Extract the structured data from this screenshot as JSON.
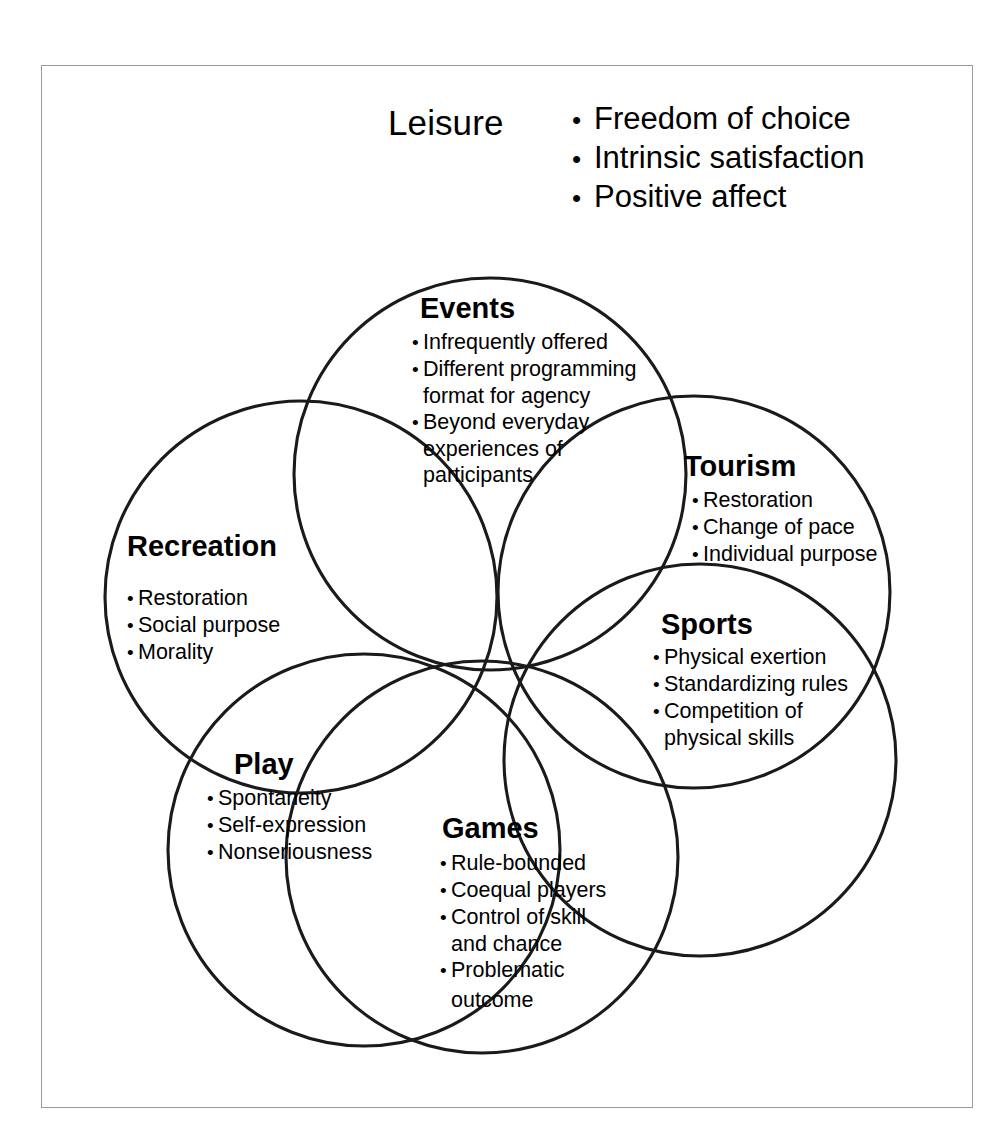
{
  "figure": {
    "header": {
      "title": "Leisure",
      "attributes": [
        "Freedom of choice",
        "Intrinsic satisfaction",
        "Positive affect"
      ]
    },
    "bullet_glyph": "•",
    "colors": {
      "circle_stroke": "#1a1a1a",
      "frame_border": "#9a9a9a",
      "background": "#ffffff",
      "text": "#000000"
    },
    "circles": [
      {
        "id": "events",
        "title": "Events",
        "items": [
          {
            "text": "Infrequently offered",
            "bulleted": true
          },
          {
            "text": "Different programming",
            "bulleted": true
          },
          {
            "text": "format for agency",
            "bulleted": false
          },
          {
            "text": "Beyond everyday",
            "bulleted": true
          },
          {
            "text": "experiences of",
            "bulleted": false
          },
          {
            "text": "participants",
            "bulleted": false
          }
        ]
      },
      {
        "id": "tourism",
        "title": "Tourism",
        "items": [
          {
            "text": "Restoration",
            "bulleted": true
          },
          {
            "text": "Change of pace",
            "bulleted": true
          },
          {
            "text": "Individual purpose",
            "bulleted": true
          }
        ]
      },
      {
        "id": "sports",
        "title": "Sports",
        "items": [
          {
            "text": "Physical exertion",
            "bulleted": true
          },
          {
            "text": "Standardizing rules",
            "bulleted": true
          },
          {
            "text": "Competition of",
            "bulleted": true
          },
          {
            "text": "physical skills",
            "bulleted": false
          }
        ]
      },
      {
        "id": "recreation",
        "title": "Recreation",
        "items": [
          {
            "text": "Restoration",
            "bulleted": true
          },
          {
            "text": "Social purpose",
            "bulleted": true
          },
          {
            "text": "Morality",
            "bulleted": true
          }
        ]
      },
      {
        "id": "play",
        "title": "Play",
        "items": [
          {
            "text": "Spontaneity",
            "bulleted": true
          },
          {
            "text": "Self-expression",
            "bulleted": true
          },
          {
            "text": "Nonseriousness",
            "bulleted": true
          }
        ]
      },
      {
        "id": "games",
        "title": "Games",
        "items": [
          {
            "text": "Rule-bounded",
            "bulleted": true
          },
          {
            "text": "Coequal players",
            "bulleted": true
          },
          {
            "text": "Control of skill",
            "bulleted": true
          },
          {
            "text": "and chance",
            "bulleted": false
          },
          {
            "text": "Problematic",
            "bulleted": true
          },
          {
            "text": "outcome",
            "bulleted": false
          }
        ]
      }
    ],
    "geometry": {
      "common_point": {
        "x": 548,
        "y": 666
      },
      "radius": 196,
      "centers": [
        {
          "id": "events",
          "cx": 490,
          "cy": 474
        },
        {
          "id": "tourism",
          "cx": 694,
          "cy": 592
        },
        {
          "id": "sports",
          "cx": 700,
          "cy": 760
        },
        {
          "id": "recreation",
          "cx": 301,
          "cy": 597
        },
        {
          "id": "play",
          "cx": 364,
          "cy": 850
        },
        {
          "id": "games",
          "cx": 482,
          "cy": 857
        }
      ]
    }
  }
}
